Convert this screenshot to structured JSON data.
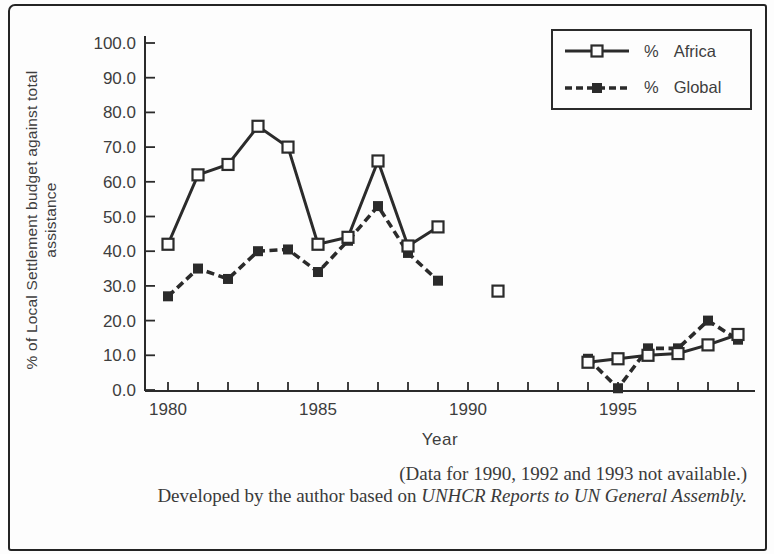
{
  "colors": {
    "ink": "#2b2b2b",
    "text": "#3e3e3e",
    "background": "#fdfdfd"
  },
  "figure": {
    "note": "(Data for 1990, 1992 and 1993 not available.)",
    "credit_prefix": "Developed by the author based on ",
    "credit_source": "UNHCR Reports to UN General Assembly."
  },
  "chart_data": {
    "type": "line",
    "title": "",
    "xlabel": "Year",
    "ylabel": "% of Local Settlement budget against total assistance",
    "xlim": [
      1979.2,
      1999.6
    ],
    "ylim": [
      0,
      100
    ],
    "grid": false,
    "legend_position": "top-right",
    "x_ticks": {
      "start": 1980,
      "end": 1999,
      "labeled": [
        1980,
        1985,
        1990,
        1995
      ]
    },
    "y_ticks": {
      "min": 0,
      "max": 100,
      "step": 10,
      "decimals": 1
    },
    "gaps_note_years": [
      1990,
      1992,
      1993
    ],
    "series": [
      {
        "prefix": "%",
        "name": "Africa",
        "style": "solid",
        "marker": "open-square",
        "points": [
          [
            1980,
            42
          ],
          [
            1981,
            62
          ],
          [
            1982,
            65
          ],
          [
            1983,
            76
          ],
          [
            1984,
            70
          ],
          [
            1985,
            42
          ],
          [
            1986,
            44
          ],
          [
            1987,
            66
          ],
          [
            1988,
            41.5
          ],
          [
            1989,
            47
          ],
          [
            1991,
            28.5
          ],
          [
            1994,
            8
          ],
          [
            1995,
            9
          ],
          [
            1996,
            10
          ],
          [
            1997,
            10.5
          ],
          [
            1998,
            13
          ],
          [
            1999,
            16
          ]
        ]
      },
      {
        "prefix": "%",
        "name": "Global",
        "style": "dashed",
        "marker": "filled-square",
        "points": [
          [
            1980,
            27
          ],
          [
            1981,
            35
          ],
          [
            1982,
            32
          ],
          [
            1983,
            40
          ],
          [
            1984,
            40.5
          ],
          [
            1985,
            34
          ],
          [
            1986,
            43
          ],
          [
            1987,
            53
          ],
          [
            1988,
            39.5
          ],
          [
            1989,
            31.5
          ],
          [
            1994,
            9
          ],
          [
            1995,
            0.5
          ],
          [
            1996,
            12
          ],
          [
            1997,
            12
          ],
          [
            1998,
            20
          ],
          [
            1999,
            14.5
          ]
        ]
      }
    ]
  }
}
